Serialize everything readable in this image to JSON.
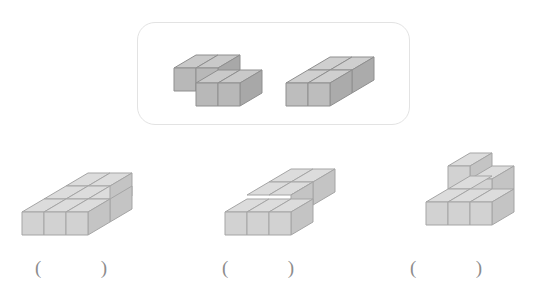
{
  "page": {
    "background_color": "#ffffff"
  },
  "prompt_box": {
    "name": "given-pieces-box",
    "border_color": "#e3e3e3",
    "pieces": [
      {
        "id": "piece-1",
        "label": "offset four-cube piece",
        "cube_count": 4,
        "shape": "S/Z shaped flat piece: two cubes in back row, two cubes in front row shifted right by one",
        "cells": [
          [
            0,
            0
          ],
          [
            1,
            0
          ],
          [
            1,
            1
          ],
          [
            2,
            1
          ]
        ],
        "fill_top": "#c9c9c9",
        "fill_left": "#a8a8a8",
        "fill_front": "#b8b8b8",
        "stroke": "#8f8f8f"
      },
      {
        "id": "piece-2",
        "label": "two-by-two square piece",
        "cube_count": 4,
        "shape": "2 x 2 flat square block",
        "cells": [
          [
            0,
            0
          ],
          [
            1,
            0
          ],
          [
            0,
            1
          ],
          [
            1,
            1
          ]
        ],
        "fill_top": "#cfcfcf",
        "fill_left": "#ababab",
        "fill_front": "#bdbdbd",
        "stroke": "#8f8f8f"
      }
    ]
  },
  "options": [
    {
      "id": "option-a",
      "index": 1,
      "label": "Option 1",
      "description": "Flat slab of eight cubes: a 3 by 2 block with two extra cubes at the right back",
      "cube_count": 8,
      "cells": [
        [
          0,
          0
        ],
        [
          1,
          0
        ],
        [
          2,
          0
        ],
        [
          0,
          1
        ],
        [
          1,
          1
        ],
        [
          2,
          1
        ],
        [
          3,
          1
        ]
      ],
      "answer_text": "",
      "paren_open": "(",
      "paren_close": ")"
    },
    {
      "id": "option-b",
      "index": 2,
      "label": "Option 2",
      "description": "Staggered flat slab of eight cubes, back row shifted right relative to front row",
      "cube_count": 8,
      "cells": [
        [
          0,
          0
        ],
        [
          1,
          0
        ],
        [
          2,
          0
        ],
        [
          3,
          0
        ],
        [
          0,
          1
        ],
        [
          1,
          1
        ],
        [
          2,
          1
        ]
      ],
      "answer_text": "",
      "paren_open": "(",
      "paren_close": ")"
    },
    {
      "id": "option-c",
      "index": 3,
      "label": "Option 3",
      "description": "L-shaped base of cubes with one cube stacked on the top level",
      "cube_count": 6,
      "cells": [
        [
          0,
          0
        ],
        [
          1,
          0
        ],
        [
          1,
          1
        ],
        [
          2,
          1
        ]
      ],
      "answer_text": "",
      "paren_open": "(",
      "paren_close": ")"
    }
  ],
  "colors": {
    "cube_top": "#dcdcdc",
    "cube_left": "#c4c4c4",
    "cube_front": "#d2d2d2",
    "cube_stroke": "#a5a5a5",
    "dark_cube_top": "#c9c9c9",
    "dark_cube_left": "#a8a8a8",
    "dark_cube_front": "#b8b8b8",
    "dark_cube_stroke": "#8f8f8f",
    "box_border": "#e3e3e3",
    "paren_color": "#8c8c8c",
    "page_background": "#ffffff"
  }
}
